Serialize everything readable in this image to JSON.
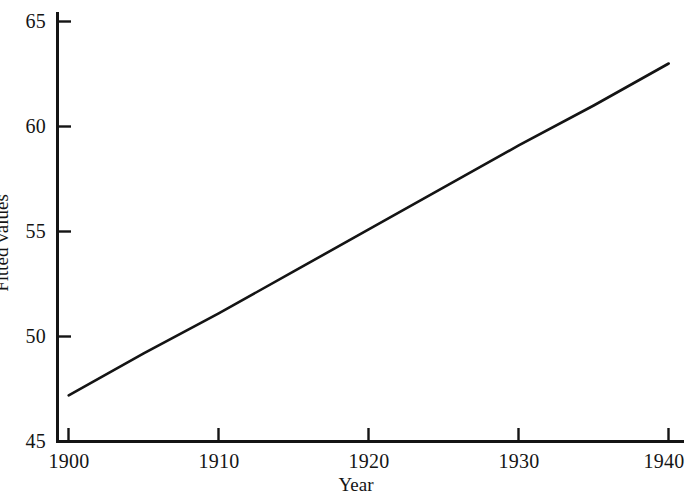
{
  "figure": {
    "background_color": "#ffffff",
    "ink_color": "#141414"
  },
  "axes": {
    "x_title": "Year",
    "y_title": "Fitted values",
    "x_tick_labels": [
      "1900",
      "1910",
      "1920",
      "1930",
      "1940"
    ],
    "y_tick_labels": [
      "45",
      "50",
      "55",
      "60",
      "65"
    ]
  },
  "chart_data": {
    "type": "line",
    "title": "",
    "subtitle": "",
    "xlabel": "Year",
    "ylabel": "Fitted values",
    "xlim": [
      1900,
      1940
    ],
    "ylim": [
      45,
      65
    ],
    "xticks": [
      1900,
      1910,
      1920,
      1930,
      1940
    ],
    "yticks": [
      45,
      50,
      55,
      60,
      65
    ],
    "grid": false,
    "legend": false,
    "legend_position": "none",
    "annotations": [],
    "series": [
      {
        "name": "Fitted values",
        "color": "#141414",
        "line_width": 2,
        "x": [
          1900,
          1905,
          1910,
          1915,
          1920,
          1925,
          1930,
          1935,
          1940
        ],
        "values": [
          47.2,
          49.2,
          51.1,
          53.1,
          55.1,
          57.1,
          59.1,
          61.0,
          63.0
        ]
      }
    ]
  }
}
